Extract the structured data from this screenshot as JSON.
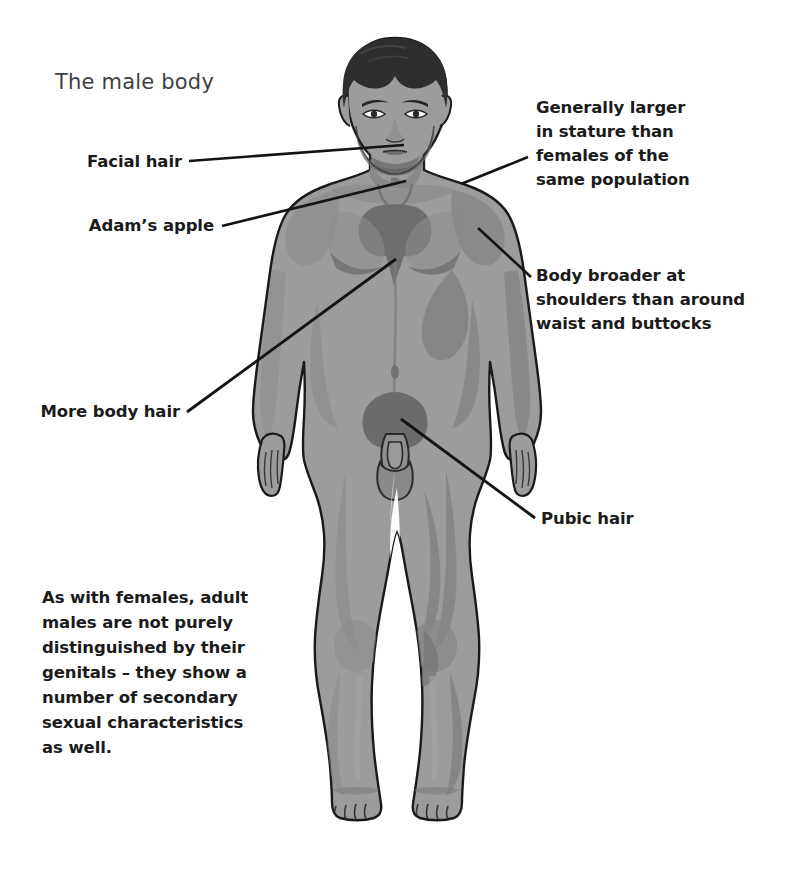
{
  "page": {
    "title": "The male body",
    "background_color": "#ffffff",
    "width": 790,
    "height": 893
  },
  "figure": {
    "name": "adult-male-body-front-view",
    "skin_fill": "#9c9c9c",
    "shade_fill": "#868686",
    "deep_shade_fill": "#737373",
    "hair_fill": "#2e2e2e",
    "outline_color": "#1a1a1a",
    "body_hair_color": "#6f6f6f"
  },
  "labels": {
    "facial_hair": "Facial hair",
    "adams_apple": "Adam’s apple",
    "more_body_hair": "More body hair",
    "generally_larger": "Generally larger\nin stature than\nfemales of the\nsame population",
    "body_broader": "Body broader at\nshoulders than around\nwaist and buttocks",
    "pubic_hair": "Pubic hair"
  },
  "note": {
    "text": "As with females, adult\nmales are not purely\ndistinguished by their\ngenitals – they show a\nnumber of secondary\nsexual characteristics\nas well."
  },
  "leader_lines": [
    {
      "name": "leader-facial-hair",
      "x1": 189,
      "y1": 161,
      "x2": 404,
      "y2": 145
    },
    {
      "name": "leader-adams-apple",
      "x1": 222,
      "y1": 226,
      "x2": 406,
      "y2": 181
    },
    {
      "name": "leader-more-body-hair",
      "x1": 187,
      "y1": 412,
      "x2": 396,
      "y2": 259
    },
    {
      "name": "leader-generally-larger",
      "x1": 528,
      "y1": 157,
      "x2": 461,
      "y2": 184
    },
    {
      "name": "leader-body-broader",
      "x1": 531,
      "y1": 277,
      "x2": 478,
      "y2": 228
    },
    {
      "name": "leader-pubic-hair",
      "x1": 535,
      "y1": 518,
      "x2": 401,
      "y2": 419
    }
  ]
}
